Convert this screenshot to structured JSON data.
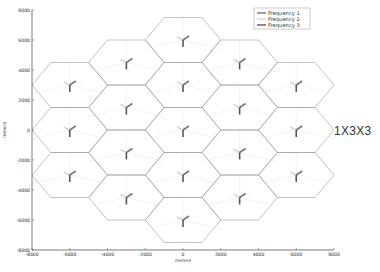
{
  "side_label": "1X3X3",
  "chart_data": {
    "type": "scatter",
    "title": "",
    "subtitle": "1X3X3",
    "xlabel": "meters",
    "ylabel": "meters",
    "xlim": [
      -8000,
      8000
    ],
    "ylim": [
      -8000,
      8000
    ],
    "x_ticks": [
      -8000,
      -6000,
      -4000,
      -2000,
      0,
      2000,
      4000,
      6000,
      8000
    ],
    "y_ticks": [
      -8000,
      -6000,
      -4000,
      -2000,
      0,
      2000,
      4000,
      6000,
      8000
    ],
    "grid": false,
    "legend_position": "upper right",
    "legend": [
      {
        "label": "Frequency 1",
        "color": "#777777"
      },
      {
        "label": "Frequency 2",
        "color": "#d6d6d6"
      },
      {
        "label": "Frequency 3",
        "color": "#555555"
      }
    ],
    "cell_shape": "hexagon",
    "cell_radius_m": 2000,
    "sectors_per_site": 3,
    "site_centers": [
      {
        "x": 0,
        "y": 6000
      },
      {
        "x": 0,
        "y": 3000
      },
      {
        "x": 0,
        "y": 0
      },
      {
        "x": 0,
        "y": -3000
      },
      {
        "x": 0,
        "y": -6000
      },
      {
        "x": -3000,
        "y": 4500
      },
      {
        "x": -3000,
        "y": 1500
      },
      {
        "x": -3000,
        "y": -1500
      },
      {
        "x": -3000,
        "y": -4500
      },
      {
        "x": 3000,
        "y": 4500
      },
      {
        "x": 3000,
        "y": 1500
      },
      {
        "x": 3000,
        "y": -1500
      },
      {
        "x": 3000,
        "y": -4500
      },
      {
        "x": -6000,
        "y": 3000
      },
      {
        "x": -6000,
        "y": 0
      },
      {
        "x": -6000,
        "y": -3000
      },
      {
        "x": 6000,
        "y": 3000
      },
      {
        "x": 6000,
        "y": 0
      },
      {
        "x": 6000,
        "y": -3000
      }
    ]
  }
}
